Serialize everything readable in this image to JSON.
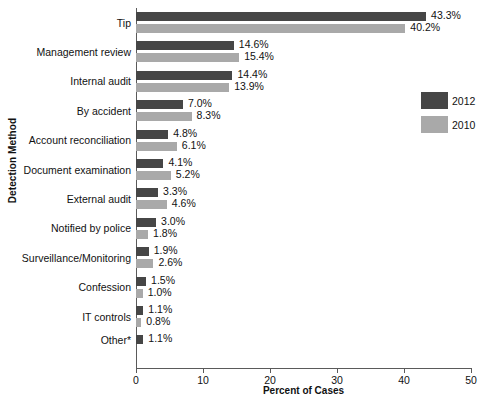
{
  "chart_data": {
    "type": "bar",
    "orientation": "horizontal",
    "title": "",
    "xlabel": "Percent of Cases",
    "ylabel": "Detection Method",
    "xlim": [
      0,
      50
    ],
    "xticks": [
      0,
      10,
      20,
      30,
      40,
      50
    ],
    "grid": false,
    "legend_position": "right",
    "categories": [
      "Tip",
      "Management review",
      "Internal audit",
      "By accident",
      "Account reconciliation",
      "Document examination",
      "External audit",
      "Notified by police",
      "Surveillance/Monitoring",
      "Confession",
      "IT controls",
      "Other*"
    ],
    "series": [
      {
        "name": "2012",
        "color": "#464646",
        "values": [
          43.3,
          14.6,
          14.4,
          7.0,
          4.8,
          4.1,
          3.3,
          3.0,
          1.9,
          1.5,
          1.1,
          1.1
        ],
        "labels": [
          "43.3%",
          "14.6%",
          "14.4%",
          "7.0%",
          "4.8%",
          "4.1%",
          "3.3%",
          "3.0%",
          "1.9%",
          "1.5%",
          "1.1%",
          "1.1%"
        ]
      },
      {
        "name": "2010",
        "color": "#a9a9a9",
        "values": [
          40.2,
          15.4,
          13.9,
          8.3,
          6.1,
          5.2,
          4.6,
          1.8,
          2.6,
          1.0,
          0.8,
          null
        ],
        "labels": [
          "40.2%",
          "15.4%",
          "13.9%",
          "8.3%",
          "6.1%",
          "5.2%",
          "4.6%",
          "1.8%",
          "2.6%",
          "1.0%",
          "0.8%",
          ""
        ]
      }
    ]
  },
  "legend": {
    "entries": [
      {
        "label": "2012",
        "color": "#464646"
      },
      {
        "label": "2010",
        "color": "#a9a9a9"
      }
    ]
  },
  "axes": {
    "x_title": "Percent of Cases",
    "y_title": "Detection Method",
    "x_tick_labels": [
      "0",
      "10",
      "20",
      "30",
      "40",
      "50"
    ]
  }
}
